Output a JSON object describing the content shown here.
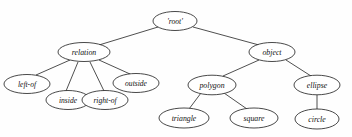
{
  "diagram": {
    "background_color": "#fefefe",
    "node_fill": "#ffffff",
    "node_stroke": "#1a1a1a",
    "edge_color": "#222222",
    "label_color": "#111111",
    "nodes": [
      {
        "id": "root",
        "label": "'root'",
        "cx": 175,
        "cy": 21,
        "rx": 22,
        "ry": 9.5,
        "font_size": 7.6
      },
      {
        "id": "relation",
        "label": "relation",
        "cx": 84,
        "cy": 52,
        "rx": 26,
        "ry": 9.5,
        "font_size": 7.8
      },
      {
        "id": "object",
        "label": "object",
        "cx": 272,
        "cy": 52,
        "rx": 23,
        "ry": 9.5,
        "font_size": 7.8
      },
      {
        "id": "left-of",
        "label": "left-of",
        "cx": 27,
        "cy": 84,
        "rx": 23,
        "ry": 9.5,
        "font_size": 7.6
      },
      {
        "id": "inside",
        "label": "inside",
        "cx": 68,
        "cy": 100,
        "rx": 22,
        "ry": 9.5,
        "font_size": 7.6
      },
      {
        "id": "right-of",
        "label": "right-of",
        "cx": 105,
        "cy": 100,
        "rx": 23,
        "ry": 9.5,
        "font_size": 7.6
      },
      {
        "id": "outside",
        "label": "outside",
        "cx": 136,
        "cy": 83,
        "rx": 23,
        "ry": 9.5,
        "font_size": 7.6
      },
      {
        "id": "polygon",
        "label": "polygon",
        "cx": 212,
        "cy": 85,
        "rx": 24,
        "ry": 9.8,
        "font_size": 7.8
      },
      {
        "id": "ellipse",
        "label": "ellipse",
        "cx": 317,
        "cy": 85,
        "rx": 23,
        "ry": 9.8,
        "font_size": 7.8
      },
      {
        "id": "triangle",
        "label": "triangle",
        "cx": 184,
        "cy": 118,
        "rx": 25,
        "ry": 10,
        "font_size": 7.8
      },
      {
        "id": "square",
        "label": "square",
        "cx": 254,
        "cy": 118,
        "rx": 24,
        "ry": 10,
        "font_size": 7.8
      },
      {
        "id": "circle",
        "label": "circle",
        "cx": 317,
        "cy": 119,
        "rx": 22,
        "ry": 10,
        "font_size": 7.8
      }
    ],
    "edges": [
      {
        "from": "root",
        "to": "relation",
        "x1": 158,
        "y1": 27,
        "x2": 99,
        "y2": 45
      },
      {
        "from": "root",
        "to": "object",
        "x1": 193,
        "y1": 27,
        "x2": 259,
        "y2": 45
      },
      {
        "from": "relation",
        "to": "left-of",
        "x1": 70,
        "y1": 60,
        "x2": 36,
        "y2": 75
      },
      {
        "from": "relation",
        "to": "inside",
        "x1": 78,
        "y1": 62,
        "x2": 66,
        "y2": 91
      },
      {
        "from": "relation",
        "to": "right-of",
        "x1": 90,
        "y1": 62,
        "x2": 104,
        "y2": 91
      },
      {
        "from": "relation",
        "to": "outside",
        "x1": 99,
        "y1": 60,
        "x2": 130,
        "y2": 74
      },
      {
        "from": "object",
        "to": "polygon",
        "x1": 259,
        "y1": 60,
        "x2": 223,
        "y2": 76
      },
      {
        "from": "object",
        "to": "ellipse",
        "x1": 286,
        "y1": 60,
        "x2": 311,
        "y2": 76
      },
      {
        "from": "polygon",
        "to": "triangle",
        "x1": 201,
        "y1": 93,
        "x2": 189,
        "y2": 109
      },
      {
        "from": "polygon",
        "to": "square",
        "x1": 224,
        "y1": 93,
        "x2": 247,
        "y2": 109
      },
      {
        "from": "ellipse",
        "to": "circle",
        "x1": 317,
        "y1": 95,
        "x2": 317,
        "y2": 109
      }
    ]
  }
}
